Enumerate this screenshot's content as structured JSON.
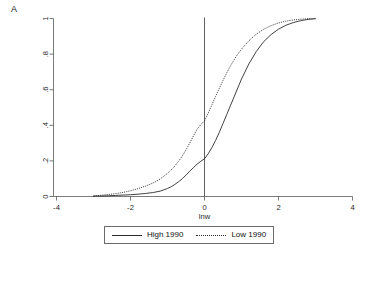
{
  "figure": {
    "panel_label": "A",
    "background_color": "#ffffff",
    "ink_color": "#2b2b2b"
  },
  "chart_data": {
    "type": "line",
    "title": "",
    "subtitle": "",
    "panel": "A",
    "xlabel": "lnw",
    "ylabel": "",
    "xlim": [
      -4,
      4
    ],
    "ylim": [
      0,
      1
    ],
    "xticks": [
      -4,
      -2,
      0,
      2,
      4
    ],
    "xticklabels": [
      "-4",
      "-2",
      "0",
      "2",
      "4"
    ],
    "yticks": [
      0,
      0.2,
      0.4,
      0.6,
      0.8,
      1
    ],
    "yticklabels": [
      "0",
      ".2",
      ".4",
      ".6",
      ".8",
      "1"
    ],
    "ytick_label_rotation": 90,
    "grid": false,
    "legend_position": "below-axes",
    "annotations": [
      {
        "type": "vertical-reference-line",
        "x": 0,
        "label": ""
      }
    ],
    "series": [
      {
        "name": "High 1990",
        "style": "solid",
        "color": "#2b2b2b",
        "x": [
          -3.0,
          -2.8,
          -2.6,
          -2.4,
          -2.2,
          -2.0,
          -1.8,
          -1.6,
          -1.4,
          -1.2,
          -1.0,
          -0.9,
          -0.8,
          -0.7,
          -0.6,
          -0.5,
          -0.4,
          -0.3,
          -0.2,
          -0.1,
          0.0,
          0.1,
          0.2,
          0.3,
          0.4,
          0.5,
          0.6,
          0.7,
          0.8,
          0.9,
          1.0,
          1.2,
          1.4,
          1.6,
          1.8,
          2.0,
          2.2,
          2.4,
          2.6,
          2.8,
          3.0
        ],
        "y": [
          0.002,
          0.003,
          0.004,
          0.006,
          0.008,
          0.01,
          0.013,
          0.017,
          0.022,
          0.03,
          0.045,
          0.055,
          0.068,
          0.083,
          0.1,
          0.12,
          0.142,
          0.162,
          0.182,
          0.198,
          0.212,
          0.24,
          0.275,
          0.315,
          0.36,
          0.41,
          0.46,
          0.51,
          0.56,
          0.61,
          0.66,
          0.745,
          0.815,
          0.87,
          0.91,
          0.94,
          0.962,
          0.977,
          0.988,
          0.995,
          0.999
        ]
      },
      {
        "name": "Low 1990",
        "style": "dotted",
        "color": "#2b2b2b",
        "x": [
          -3.0,
          -2.8,
          -2.6,
          -2.4,
          -2.2,
          -2.0,
          -1.8,
          -1.6,
          -1.4,
          -1.2,
          -1.0,
          -0.9,
          -0.8,
          -0.7,
          -0.6,
          -0.5,
          -0.4,
          -0.3,
          -0.2,
          -0.1,
          0.0,
          0.1,
          0.2,
          0.3,
          0.4,
          0.5,
          0.6,
          0.7,
          0.8,
          0.9,
          1.0,
          1.2,
          1.4,
          1.6,
          1.8,
          2.0,
          2.2,
          2.4,
          2.6,
          2.8,
          3.0
        ],
        "y": [
          0.004,
          0.007,
          0.011,
          0.016,
          0.023,
          0.032,
          0.044,
          0.058,
          0.075,
          0.098,
          0.13,
          0.15,
          0.172,
          0.198,
          0.228,
          0.262,
          0.3,
          0.34,
          0.378,
          0.404,
          0.425,
          0.468,
          0.515,
          0.562,
          0.608,
          0.652,
          0.694,
          0.733,
          0.768,
          0.8,
          0.828,
          0.875,
          0.912,
          0.94,
          0.96,
          0.975,
          0.985,
          0.992,
          0.996,
          0.999,
          1.0
        ]
      }
    ]
  },
  "legend": {
    "entries": [
      {
        "label": "High 1990",
        "style": "solid"
      },
      {
        "label": "Low 1990",
        "style": "dotted"
      }
    ]
  }
}
